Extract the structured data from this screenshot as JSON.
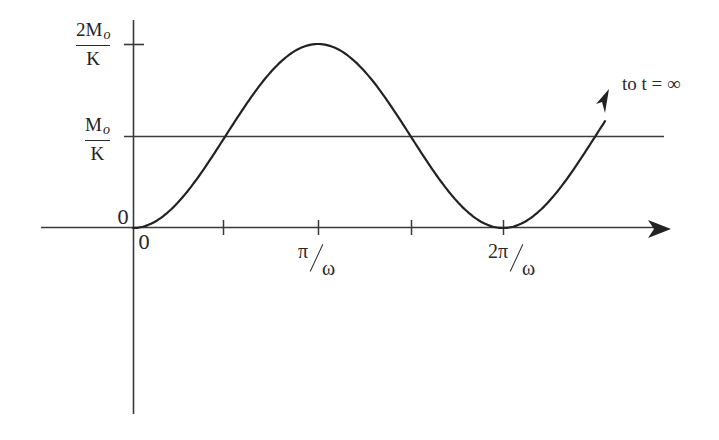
{
  "diagram": {
    "colors": {
      "ink": "#2a2a2a",
      "background": "#ffffff"
    },
    "y_labels": {
      "top": {
        "numerator": "2M",
        "subscript": "o",
        "denominator": "K"
      },
      "middle": {
        "numerator": "M",
        "subscript": "o",
        "denominator": "K"
      },
      "origin": "0"
    },
    "x_labels": {
      "origin": "0",
      "pi_over_omega": {
        "numerator": "π",
        "denominator": "ω"
      },
      "two_pi_over_omega": {
        "numerator": "2π",
        "denominator": "ω"
      }
    },
    "annotation": "to t = ∞",
    "reference_line": "Mo/K horizontal line",
    "ticks_x": [
      "π/2ω",
      "π/ω",
      "3π/2ω",
      "2π/ω"
    ],
    "ticks_y": [
      "2Mo/K",
      "Mo/K"
    ]
  }
}
